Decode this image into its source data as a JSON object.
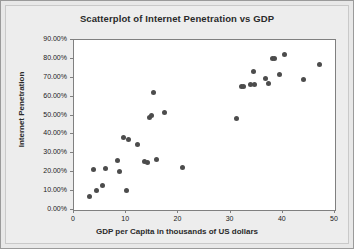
{
  "chart_data": {
    "type": "scatter",
    "title": "Scatterplot of Internet Penetration vs GDP",
    "xlabel": "GDP per Capita in thousands of US dollars",
    "ylabel": "Internet Penetration",
    "xlim": [
      0,
      50
    ],
    "ylim": [
      0,
      90
    ],
    "grid": false,
    "legend": "none",
    "xticks": [
      0,
      10,
      20,
      30,
      40,
      50
    ],
    "xtick_labels": [
      "0",
      "10",
      "20",
      "30",
      "40",
      "50"
    ],
    "yticks": [
      0,
      10,
      20,
      30,
      40,
      50,
      60,
      70,
      80,
      90
    ],
    "ytick_labels": [
      "0.00%",
      "10.00%",
      "20.00%",
      "30.00%",
      "40.00%",
      "50.00%",
      "60.00%",
      "70.00%",
      "80.00%",
      "90.00%"
    ],
    "marker": "filled-circle",
    "marker_color": "#4c4c4c",
    "points": [
      {
        "x": 3.0,
        "y": 6.9
      },
      {
        "x": 3.7,
        "y": 21.4
      },
      {
        "x": 4.3,
        "y": 10.4
      },
      {
        "x": 5.4,
        "y": 13.0
      },
      {
        "x": 6.0,
        "y": 22.2
      },
      {
        "x": 8.4,
        "y": 26.1
      },
      {
        "x": 8.7,
        "y": 20.4
      },
      {
        "x": 9.4,
        "y": 38.4
      },
      {
        "x": 10.0,
        "y": 10.2
      },
      {
        "x": 10.4,
        "y": 37.4
      },
      {
        "x": 12.1,
        "y": 34.8
      },
      {
        "x": 13.6,
        "y": 25.6
      },
      {
        "x": 14.0,
        "y": 25.2
      },
      {
        "x": 14.4,
        "y": 49.0
      },
      {
        "x": 14.9,
        "y": 50.2
      },
      {
        "x": 15.2,
        "y": 62.3
      },
      {
        "x": 15.9,
        "y": 26.8
      },
      {
        "x": 17.3,
        "y": 51.6
      },
      {
        "x": 20.8,
        "y": 22.3
      },
      {
        "x": 31.1,
        "y": 48.6
      },
      {
        "x": 32.0,
        "y": 65.3
      },
      {
        "x": 32.4,
        "y": 65.3
      },
      {
        "x": 33.8,
        "y": 66.4
      },
      {
        "x": 34.4,
        "y": 73.4
      },
      {
        "x": 34.6,
        "y": 66.4
      },
      {
        "x": 36.6,
        "y": 69.6
      },
      {
        "x": 37.3,
        "y": 67.1
      },
      {
        "x": 38.1,
        "y": 80.2
      },
      {
        "x": 38.4,
        "y": 80.1
      },
      {
        "x": 39.3,
        "y": 71.9
      },
      {
        "x": 40.4,
        "y": 82.4
      },
      {
        "x": 44.0,
        "y": 68.9
      },
      {
        "x": 47.0,
        "y": 76.8
      }
    ]
  }
}
